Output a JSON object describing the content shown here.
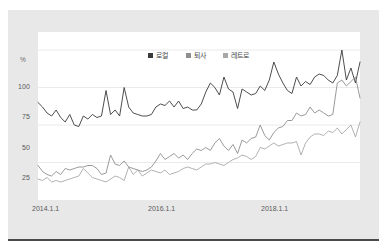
{
  "chart_data": {
    "type": "line",
    "title": "",
    "subtitle": "",
    "xlabel": "",
    "ylabel": "",
    "unit_label": "%",
    "grid": true,
    "legend_position": "top-center",
    "ylim": [
      0,
      112
    ],
    "yticks": [
      25,
      50,
      75,
      100
    ],
    "ytick_labels": [
      "25",
      "50",
      "75",
      "100"
    ],
    "xtick_labels": [
      "2014.1.1",
      "2016.1.1",
      "2018.1.1"
    ],
    "xtick_positions": [
      0,
      24,
      48
    ],
    "x_count": 66,
    "colors": {
      "series1": "#3a3a3a",
      "series2": "#8e8e8e",
      "series3": "#a8a8a8",
      "grid": "#e4e4e4",
      "plot_background": "#ffffff",
      "card_background": "#e8e8e8",
      "rule": "#4a4a4a",
      "text": "#5a5a5a"
    },
    "series": [
      {
        "name": "로컬",
        "color": "#3a3a3a",
        "values": [
          65,
          62,
          58,
          56,
          60,
          55,
          52,
          57,
          50,
          49,
          56,
          54,
          57,
          55,
          56,
          73,
          57,
          60,
          56,
          75,
          62,
          58,
          57,
          56,
          56,
          57,
          62,
          64,
          63,
          66,
          62,
          66,
          61,
          62,
          60,
          60,
          64,
          72,
          78,
          75,
          70,
          82,
          74,
          72,
          61,
          74,
          72,
          70,
          71,
          76,
          73,
          80,
          92,
          84,
          78,
          73,
          71,
          82,
          76,
          79,
          77,
          82,
          84,
          83,
          80,
          78,
          83,
          100,
          80,
          88,
          78,
          92
        ]
      },
      {
        "name": "퇴사",
        "color": "#8e8e8e",
        "values": [
          23,
          19,
          17,
          16,
          19,
          17,
          21,
          20,
          21,
          22,
          22,
          23,
          23,
          21,
          17,
          18,
          30,
          24,
          23,
          26,
          22,
          21,
          20,
          19,
          20,
          22,
          26,
          31,
          27,
          29,
          31,
          28,
          30,
          27,
          31,
          34,
          33,
          35,
          33,
          38,
          41,
          36,
          33,
          37,
          31,
          40,
          38,
          41,
          42,
          50,
          43,
          40,
          45,
          48,
          49,
          53,
          53,
          58,
          56,
          57,
          62,
          58,
          60,
          58,
          56,
          57,
          78,
          80,
          76,
          79,
          82,
          68
        ]
      },
      {
        "name": "레트로",
        "color": "#a8a8a8",
        "values": [
          14,
          13,
          15,
          12,
          13,
          12,
          13,
          14,
          15,
          16,
          21,
          18,
          15,
          14,
          13,
          12,
          14,
          16,
          15,
          13,
          22,
          17,
          20,
          16,
          18,
          20,
          19,
          18,
          20,
          17,
          18,
          19,
          21,
          22,
          21,
          20,
          22,
          24,
          24,
          25,
          24,
          23,
          25,
          27,
          28,
          30,
          29,
          27,
          29,
          35,
          34,
          36,
          38,
          36,
          37,
          38,
          38,
          39,
          30,
          38,
          42,
          44,
          44,
          43,
          46,
          45,
          48,
          44,
          47,
          50,
          42,
          52
        ]
      }
    ]
  },
  "legend": {
    "items": [
      {
        "label": "로컬",
        "color": "#3a3a3a"
      },
      {
        "label": "퇴사",
        "color": "#8e8e8e"
      },
      {
        "label": "레트로",
        "color": "#a8a8a8"
      }
    ]
  },
  "axes": {
    "unit": "%",
    "y_labels": [
      "100",
      "75",
      "50",
      "25"
    ],
    "x_labels": [
      "2014.1.1",
      "2016.1.1",
      "2018.1.1"
    ]
  }
}
